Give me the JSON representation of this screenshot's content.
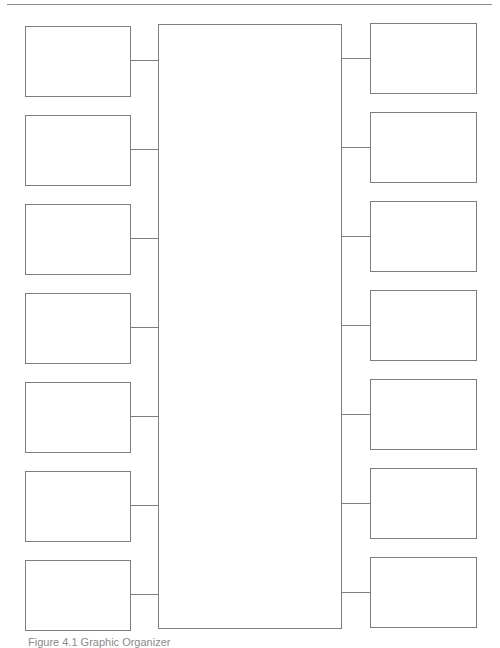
{
  "diagram": {
    "type": "graphic-organizer",
    "center": {
      "label": ""
    },
    "left_boxes": [
      {
        "label": "",
        "top": 26
      },
      {
        "label": "",
        "top": 115
      },
      {
        "label": "",
        "top": 204
      },
      {
        "label": "",
        "top": 293
      },
      {
        "label": "",
        "top": 382
      },
      {
        "label": "",
        "top": 471
      },
      {
        "label": "",
        "top": 560
      }
    ],
    "right_boxes": [
      {
        "label": "",
        "top": 23
      },
      {
        "label": "",
        "top": 112
      },
      {
        "label": "",
        "top": 201
      },
      {
        "label": "",
        "top": 290
      },
      {
        "label": "",
        "top": 379
      },
      {
        "label": "",
        "top": 468
      },
      {
        "label": "",
        "top": 557
      }
    ],
    "line_color": "#7d7d7d"
  },
  "caption": "Figure 4.1 Graphic Organizer"
}
